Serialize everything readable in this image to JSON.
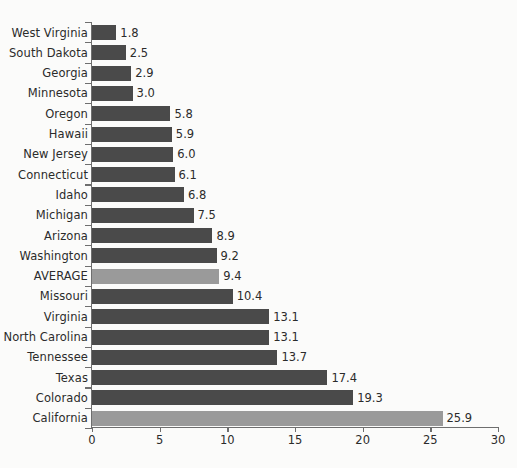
{
  "chart_data": {
    "type": "bar",
    "orientation": "horizontal",
    "title": "",
    "subtitle": "",
    "xlabel": "",
    "ylabel": "",
    "xlim": [
      0,
      30
    ],
    "ylim": null,
    "grid": false,
    "legend": null,
    "xticks": [
      0,
      5,
      10,
      15,
      20,
      25,
      30
    ],
    "xtick_labels": [
      "0",
      "5",
      "10",
      "15",
      "20",
      "25",
      "30"
    ],
    "categories": [
      "West Virginia",
      "South Dakota",
      "Georgia",
      "Minnesota",
      "Oregon",
      "Hawaii",
      "New Jersey",
      "Connecticut",
      "Idaho",
      "Michigan",
      "Arizona",
      "Washington",
      "AVERAGE",
      "Missouri",
      "Virginia",
      "North Carolina",
      "Tennessee",
      "Texas",
      "Colorado",
      "California"
    ],
    "values": [
      1.8,
      2.5,
      2.9,
      3.0,
      5.8,
      5.9,
      6.0,
      6.1,
      6.8,
      7.5,
      8.9,
      9.2,
      9.4,
      10.4,
      13.1,
      13.1,
      13.7,
      17.4,
      19.3,
      25.9
    ],
    "value_labels": [
      "1.8",
      "2.5",
      "2.9",
      "3.0",
      "5.8",
      "5.9",
      "6.0",
      "6.1",
      "6.8",
      "7.5",
      "8.9",
      "9.2",
      "9.4",
      "10.4",
      "13.1",
      "13.1",
      "13.7",
      "17.4",
      "19.3",
      "25.9"
    ],
    "highlighted": [
      "AVERAGE",
      "California"
    ],
    "colors": {
      "bar": "#4a4a4a",
      "bar_highlight": "#9a9a9a",
      "axis": "#6e6e6e",
      "text": "#2b2b2b",
      "background": "#fbfbfa"
    }
  }
}
